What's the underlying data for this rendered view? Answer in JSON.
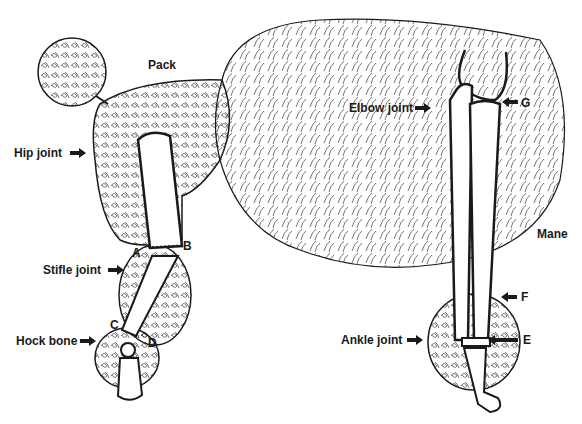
{
  "figure": {
    "labels": {
      "pack": "Pack",
      "hip_joint": "Hip joint",
      "stifle_joint": "Stifle joint",
      "hock_bone": "Hock bone",
      "elbow_joint": "Elbow joint",
      "ankle_joint": "Ankle joint",
      "mane": "Mane",
      "a": "A",
      "b": "B",
      "c": "C",
      "d": "D",
      "e": "E",
      "f": "F",
      "g": "G"
    },
    "colors": {
      "ink": "#1a1a1a",
      "background": "#ffffff"
    }
  }
}
